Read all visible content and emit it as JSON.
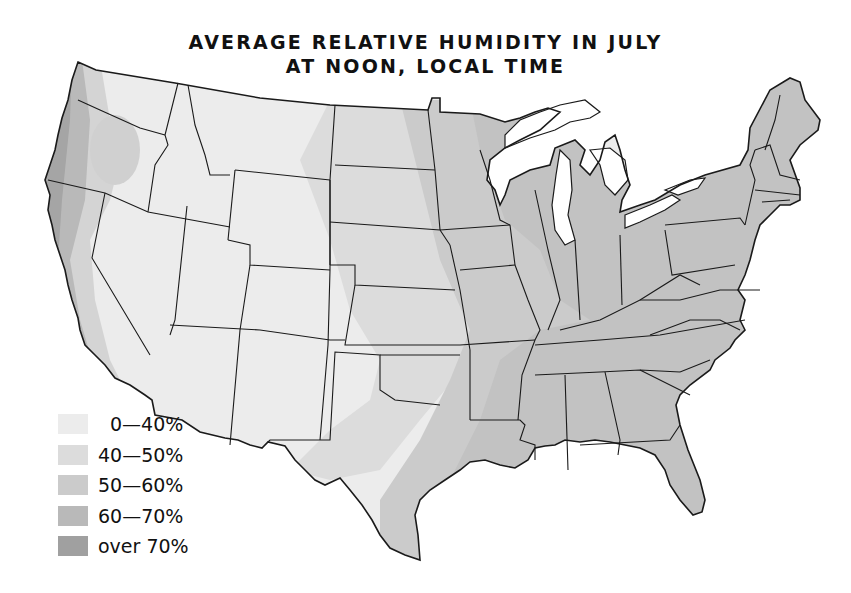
{
  "title": {
    "line1": "AVERAGE RELATIVE HUMIDITY IN JULY",
    "line2": "AT NOON, LOCAL TIME"
  },
  "legend": {
    "items": [
      {
        "label": "0—40%",
        "color": "#ececec"
      },
      {
        "label": "40—50%",
        "color": "#dcdcdc"
      },
      {
        "label": "50—60%",
        "color": "#cbcbcb"
      },
      {
        "label": "60—70%",
        "color": "#b9b9b9"
      },
      {
        "label": "over 70%",
        "color": "#a0a0a0"
      }
    ]
  },
  "map": {
    "region": "Contiguous United States",
    "colors": {
      "zone_0_40": "#ececec",
      "zone_40_50": "#dcdcdc",
      "zone_50_60": "#cbcbcb",
      "zone_60_70": "#b9b9b9",
      "zone_over_70": "#a0a0a0",
      "border": "#1a1a1a",
      "water": "#ffffff"
    }
  }
}
